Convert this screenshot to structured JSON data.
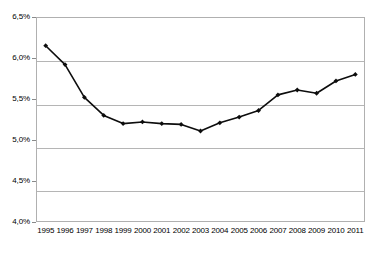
{
  "chart_data": {
    "type": "line",
    "title": "",
    "xlabel": "",
    "ylabel": "",
    "categories": [
      "1995",
      "1996",
      "1997",
      "1998",
      "1999",
      "2000",
      "2001",
      "2002",
      "2003",
      "2004",
      "2005",
      "2006",
      "2007",
      "2008",
      "2009",
      "2010",
      "2011"
    ],
    "values": [
      6.15,
      5.92,
      5.52,
      5.3,
      5.2,
      5.22,
      5.2,
      5.19,
      5.11,
      5.21,
      5.28,
      5.36,
      5.55,
      5.61,
      5.57,
      5.72,
      5.8
    ],
    "series": [
      {
        "name": "series-1",
        "values": [
          6.15,
          5.92,
          5.52,
          5.3,
          5.2,
          5.22,
          5.2,
          5.19,
          5.11,
          5.21,
          5.28,
          5.36,
          5.55,
          5.61,
          5.57,
          5.72,
          5.8
        ]
      }
    ],
    "ylim": [
      4.0,
      6.5
    ],
    "yticks": [
      4.0,
      4.5,
      5.0,
      5.5,
      6.0,
      6.5
    ],
    "ytick_labels": [
      "4,0%",
      "4,5%",
      "5,0%",
      "5,5%",
      "6,0%",
      "6,5%"
    ],
    "grid": "horizontal",
    "legend": "none",
    "marker": "diamond",
    "line_color": "#0d0d0d",
    "grid_color": "#b5b5b5",
    "background": "#ffffff"
  },
  "axes": {
    "y_ticks": [
      {
        "label": "6,5%",
        "value": 6.5
      },
      {
        "label": "6,0%",
        "value": 6.0
      },
      {
        "label": "5,5%",
        "value": 5.5
      },
      {
        "label": "5,0%",
        "value": 5.0
      },
      {
        "label": "4,5%",
        "value": 4.5
      },
      {
        "label": "4,0%",
        "value": 4.0
      }
    ],
    "x_ticks": [
      {
        "label": "1995"
      },
      {
        "label": "1996"
      },
      {
        "label": "1997"
      },
      {
        "label": "1998"
      },
      {
        "label": "1999"
      },
      {
        "label": "2000"
      },
      {
        "label": "2001"
      },
      {
        "label": "2002"
      },
      {
        "label": "2003"
      },
      {
        "label": "2004"
      },
      {
        "label": "2005"
      },
      {
        "label": "2006"
      },
      {
        "label": "2007"
      },
      {
        "label": "2008"
      },
      {
        "label": "2009"
      },
      {
        "label": "2010"
      },
      {
        "label": "2011"
      }
    ]
  }
}
